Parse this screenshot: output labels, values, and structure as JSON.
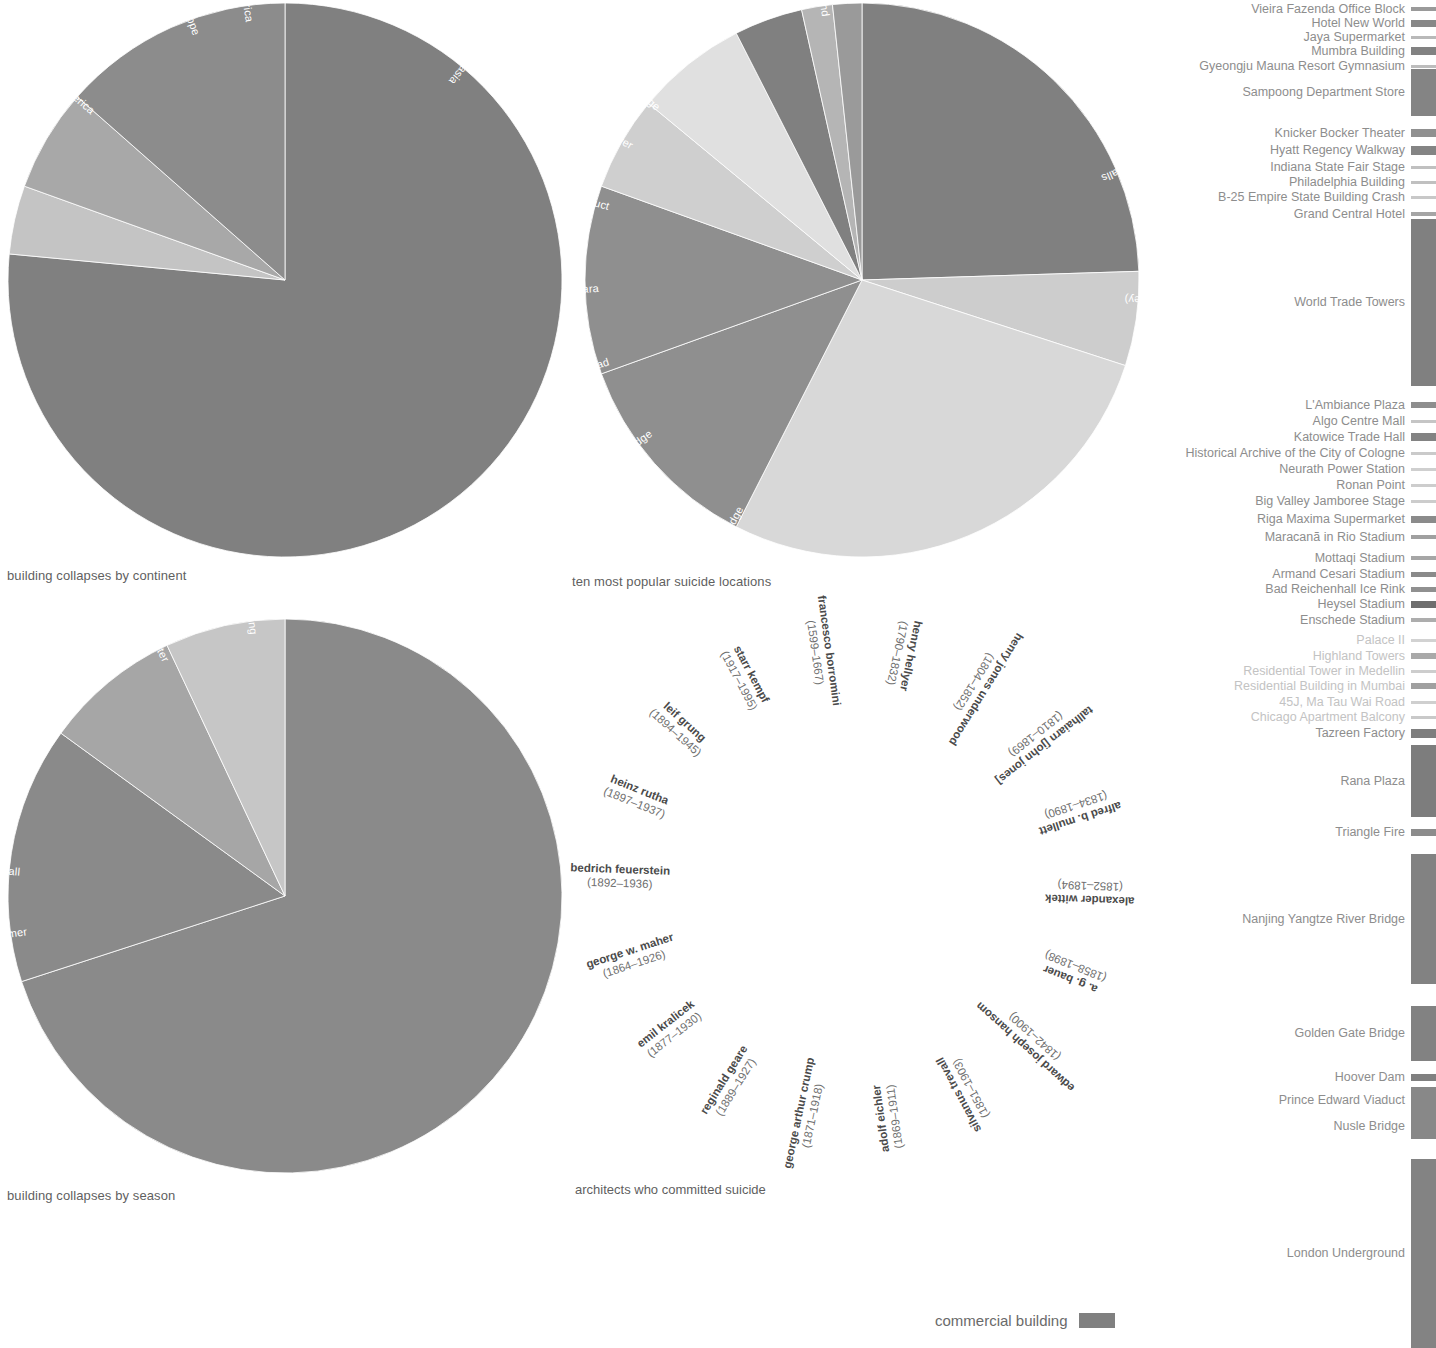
{
  "page": {
    "background": "#ffffff",
    "accent": "#808080"
  },
  "charts": [
    {
      "id": "building-collapses-by-continent",
      "caption": "building collapses by continent",
      "type": "pie"
    },
    {
      "id": "ten-most-popular-suicide-locations",
      "caption": "ten most popular suicide locations",
      "type": "pie"
    },
    {
      "id": "building-collapses-by-season",
      "caption": "building collapses by season",
      "type": "pie"
    },
    {
      "id": "architects-who-committed-suicide",
      "caption": "architects who committed suicide",
      "type": "radial-label-ring"
    }
  ],
  "chart_data": [
    {
      "type": "pie",
      "title": "building collapses by continent",
      "categories": [
        "asia",
        "north america",
        "europe",
        "south america"
      ],
      "values": [
        76.5,
        13.5,
        6.0,
        4.0
      ],
      "colors": [
        "#808080",
        "#8c8c8c",
        "#a8a8a8",
        "#c4c4c4"
      ],
      "startangle": 0,
      "direction": "clockwise",
      "legend": "inside-slices",
      "grid": false
    },
    {
      "type": "pie",
      "title": "ten most popular suicide locations",
      "categories": [
        "london underground",
        "niagra falls",
        "the gap (sydney)",
        "nanjing yangtze river bridge",
        "golden gate bridge",
        "beachy head",
        "mount mihara",
        "prince edward viaduct",
        "eiffel tower",
        "nusle bridge"
      ],
      "values": [
        24.5,
        5.5,
        27.5,
        12.0,
        11.0,
        5.5,
        6.5,
        4.0,
        1.8,
        1.7
      ],
      "colors": [
        "#808080",
        "#cdcdcd",
        "#d8d8d8",
        "#dcdcdc",
        "#808080",
        "#cfcfcf",
        "#e0e0e0",
        "#808080",
        "#b5b5b5",
        "#9a9a9a"
      ],
      "startangle": 0,
      "direction": "clockwise",
      "legend": "inside-slices",
      "grid": false
    },
    {
      "type": "pie",
      "title": "building collapses by season",
      "categories": [
        "spring",
        "summer",
        "fall",
        "winter"
      ],
      "values": [
        70.0,
        15.0,
        8.0,
        7.0
      ],
      "colors": [
        "#8a8a8a",
        "#8a8a8a",
        "#a6a6a6",
        "#c6c6c6"
      ],
      "startangle": 0,
      "direction": "clockwise",
      "legend": "inside-slices",
      "grid": false
    }
  ],
  "continent_pie": {
    "caption": "building collapses by continent",
    "slices": [
      {
        "label": "asia",
        "value": 76.5,
        "color": "#808080",
        "label_angle": 40,
        "label_r": 0.93
      },
      {
        "label": "south america",
        "value": 4.0,
        "color": "#c4c4c4",
        "label_angle": 352,
        "label_r": 0.94
      },
      {
        "label": "europe",
        "value": 6.0,
        "color": "#a8a8a8",
        "label_angle": 340,
        "label_r": 0.94
      },
      {
        "label": "north america",
        "value": 13.5,
        "color": "#8c8c8c",
        "label_angle": 311,
        "label_r": 0.92
      }
    ]
  },
  "suicide_pie": {
    "caption": "ten most popular suicide locations",
    "slices": [
      {
        "label": "london underground",
        "value": 24.5,
        "color": "#808080",
        "label_angle": 352,
        "label_r": 0.96
      },
      {
        "label": "niagra falls",
        "value": 5.5,
        "color": "#cdcdcd",
        "label_angle": 67,
        "label_r": 0.94
      },
      {
        "label": "the gap (sydney)",
        "value": 27.5,
        "color": "#d8d8d8",
        "label_angle": 94,
        "label_r": 0.95
      },
      {
        "label": "nanjing yangtze river bridge",
        "value": 12.0,
        "color": "#8f8f8f",
        "label_angle": 208,
        "label_r": 0.93
      },
      {
        "label": "golden gate bridge",
        "value": 11.0,
        "color": "#8f8f8f",
        "label_angle": 234,
        "label_r": 0.94
      },
      {
        "label": "beachy head",
        "value": 5.5,
        "color": "#cfcfcf",
        "label_angle": 252,
        "label_r": 0.96
      },
      {
        "label": "mount mihara",
        "value": 6.5,
        "color": "#e0e0e0",
        "label_angle": 268,
        "label_r": 0.95
      },
      {
        "label": "prince edward viaduct",
        "value": 4.0,
        "color": "#808080",
        "label_angle": 286,
        "label_r": 0.95
      },
      {
        "label": "eiffel tower",
        "value": 1.8,
        "color": "#b5b5b5",
        "label_angle": 300,
        "label_r": 0.96
      },
      {
        "label": "nusle bridge",
        "value": 1.7,
        "color": "#9a9a9a",
        "label_angle": 310,
        "label_r": 0.96
      }
    ]
  },
  "season_pie": {
    "caption": "building collapses by season",
    "slices": [
      {
        "label": "spring",
        "value": 70.0,
        "color": "#8a8a8a",
        "label_angle": 353,
        "label_r": 0.95
      },
      {
        "label": "summer",
        "value": 15.0,
        "color": "#8a8a8a",
        "label_angle": 262,
        "label_r": 0.94
      },
      {
        "label": "fall",
        "value": 8.0,
        "color": "#a6a6a6",
        "label_angle": 275,
        "label_r": 0.96
      },
      {
        "label": "winter",
        "value": 7.0,
        "color": "#c6c6c6",
        "label_angle": 333,
        "label_r": 0.95
      }
    ]
  },
  "architects": {
    "caption": "architects who committed suicide",
    "people": [
      {
        "name": "francesco borromini",
        "dates": "(1599–1667)"
      },
      {
        "name": "henry hellyer",
        "dates": "(1790–1832)"
      },
      {
        "name": "henry jones underwood",
        "dates": "(1804–1852)"
      },
      {
        "name": "tallhaiarn [john jones]",
        "dates": "(1810–1869)"
      },
      {
        "name": "alfred b. mullett",
        "dates": "(1834–1890)"
      },
      {
        "name": "alexander wittek",
        "dates": "(1852–1894)"
      },
      {
        "name": "a. g. bauer",
        "dates": "(1858–1898)"
      },
      {
        "name": "edward joseph hansom",
        "dates": "(1842–1900)"
      },
      {
        "name": "silvanus trevall",
        "dates": "(1851–1903)"
      },
      {
        "name": "adolf eichler",
        "dates": "(1869–1911)"
      },
      {
        "name": "george arthur crump",
        "dates": "(1871–1918)"
      },
      {
        "name": "reginald geare",
        "dates": "(1889–1927)"
      },
      {
        "name": "emil kralicek",
        "dates": "(1877–1930)"
      },
      {
        "name": "george w. maher",
        "dates": "(1864–1926)"
      },
      {
        "name": "bedrich feuerstein",
        "dates": "(1892–1936)"
      },
      {
        "name": "heinz rutha",
        "dates": "(1897–1937)"
      },
      {
        "name": "leif grung",
        "dates": "(1894–1945)"
      },
      {
        "name": "starr kempf",
        "dates": "(1917–1995)"
      }
    ]
  },
  "legend": {
    "key_label": "commercial building",
    "key_color": "#808080",
    "items": [
      {
        "label": "Vieira Fazenda Office Block",
        "top": 9,
        "bar_h": 4,
        "color": "#9a9a9a",
        "dim": false
      },
      {
        "label": "Hotel New World",
        "top": 23,
        "bar_h": 7,
        "color": "#878787",
        "dim": false
      },
      {
        "label": "Jaya Supermarket",
        "top": 37,
        "bar_h": 3,
        "color": "#b9b9b9",
        "dim": false
      },
      {
        "label": "Mumbra Building",
        "top": 51,
        "bar_h": 8,
        "color": "#828282",
        "dim": false
      },
      {
        "label": "Gyeongju Mauna Resort Gymnasium",
        "top": 66,
        "bar_h": 3,
        "color": "#bdbdbd",
        "dim": false
      },
      {
        "label": "Sampoong Department Store",
        "top": 92,
        "bar_h": 47,
        "color": "#848484",
        "dim": false
      },
      {
        "label": "Knicker Bocker Theater",
        "top": 133,
        "bar_h": 8,
        "color": "#909090",
        "dim": false
      },
      {
        "label": "Hyatt Regency Walkway",
        "top": 150,
        "bar_h": 9,
        "color": "#848484",
        "dim": false
      },
      {
        "label": "Indiana State Fair Stage",
        "top": 167,
        "bar_h": 3,
        "color": "#c0c0c0",
        "dim": false
      },
      {
        "label": "Philadelphia Building",
        "top": 182,
        "bar_h": 3,
        "color": "#c0c0c0",
        "dim": false
      },
      {
        "label": "B-25 Empire State Building Crash",
        "top": 197,
        "bar_h": 3,
        "color": "#c8c8c8",
        "dim": false
      },
      {
        "label": "Grand Central Hotel",
        "top": 214,
        "bar_h": 4,
        "color": "#a5a5a5",
        "dim": false
      },
      {
        "label": "World Trade Towers",
        "top": 302,
        "bar_h": 167,
        "color": "#808080",
        "dim": false
      },
      {
        "label": "L'Ambiance Plaza",
        "top": 405,
        "bar_h": 6,
        "color": "#8e8e8e",
        "dim": false
      },
      {
        "label": "Algo Centre Mall",
        "top": 421,
        "bar_h": 3,
        "color": "#c5c5c5",
        "dim": false
      },
      {
        "label": "Katowice Trade Hall",
        "top": 437,
        "bar_h": 8,
        "color": "#838383",
        "dim": false
      },
      {
        "label": "Historical Archive of the City of Cologne",
        "top": 453,
        "bar_h": 3,
        "color": "#cacaca",
        "dim": false
      },
      {
        "label": "Neurath Power Station",
        "top": 469,
        "bar_h": 3,
        "color": "#cfcfcf",
        "dim": false
      },
      {
        "label": "Ronan Point",
        "top": 485,
        "bar_h": 3,
        "color": "#cdcdcd",
        "dim": false
      },
      {
        "label": "Big Valley Jamboree Stage",
        "top": 501,
        "bar_h": 3,
        "color": "#cccccc",
        "dim": false
      },
      {
        "label": "Riga Maxima Supermarket",
        "top": 519,
        "bar_h": 7,
        "color": "#8b8b8b",
        "dim": false
      },
      {
        "label": "Maracanã in Rio Stadium",
        "top": 537,
        "bar_h": 4,
        "color": "#a0a0a0",
        "dim": false
      },
      {
        "label": "Mottaqi Stadium",
        "top": 558,
        "bar_h": 4,
        "color": "#a6a6a6",
        "dim": false
      },
      {
        "label": "Armand Cesari Stadium",
        "top": 574,
        "bar_h": 5,
        "color": "#8a8a8a",
        "dim": false
      },
      {
        "label": "Bad Reichenhall Ice Rink",
        "top": 589,
        "bar_h": 5,
        "color": "#909090",
        "dim": false
      },
      {
        "label": "Heysel Stadium",
        "top": 604,
        "bar_h": 7,
        "color": "#6e6e6e",
        "dim": false
      },
      {
        "label": "Enschede Stadium",
        "top": 620,
        "bar_h": 4,
        "color": "#adadad",
        "dim": false
      },
      {
        "label": "Palace II",
        "top": 640,
        "bar_h": 3,
        "color": "#d2d2d2",
        "dim": true
      },
      {
        "label": "Highland Towers",
        "top": 656,
        "bar_h": 6,
        "color": "#a9a9a9",
        "dim": true
      },
      {
        "label": "Residential Tower in Medellin",
        "top": 671,
        "bar_h": 3,
        "color": "#cdcdcd",
        "dim": true
      },
      {
        "label": "Residential Building in Mumbai",
        "top": 686,
        "bar_h": 6,
        "color": "#a0a0a0",
        "dim": true
      },
      {
        "label": "45J, Ma Tau Wai Road",
        "top": 702,
        "bar_h": 3,
        "color": "#cfcfcf",
        "dim": true
      },
      {
        "label": "Chicago Apartment Balcony",
        "top": 717,
        "bar_h": 3,
        "color": "#c9c9c9",
        "dim": true
      },
      {
        "label": "Tazreen Factory",
        "top": 733,
        "bar_h": 9,
        "color": "#7e7e7e",
        "dim": false
      },
      {
        "label": "Rana Plaza",
        "top": 781,
        "bar_h": 72,
        "color": "#7d7d7d",
        "dim": false
      },
      {
        "label": "Triangle Fire",
        "top": 832,
        "bar_h": 7,
        "color": "#8c8c8c",
        "dim": false
      },
      {
        "label": "Nanjing Yangtze River Bridge",
        "top": 919,
        "bar_h": 130,
        "color": "#828282",
        "dim": false
      },
      {
        "label": "Golden Gate Bridge",
        "top": 1033,
        "bar_h": 55,
        "color": "#828282",
        "dim": false
      },
      {
        "label": "Hoover Dam",
        "top": 1077,
        "bar_h": 7,
        "color": "#808080",
        "dim": false
      },
      {
        "label": "Prince Edward Viaduct",
        "top": 1100,
        "bar_h": 26,
        "color": "#888888",
        "dim": false
      },
      {
        "label": "Nusle Bridge",
        "top": 1126,
        "bar_h": 26,
        "color": "#888888",
        "dim": false
      },
      {
        "label": "London Underground",
        "top": 1253,
        "bar_h": 189,
        "color": "#838383",
        "dim": false
      }
    ]
  }
}
